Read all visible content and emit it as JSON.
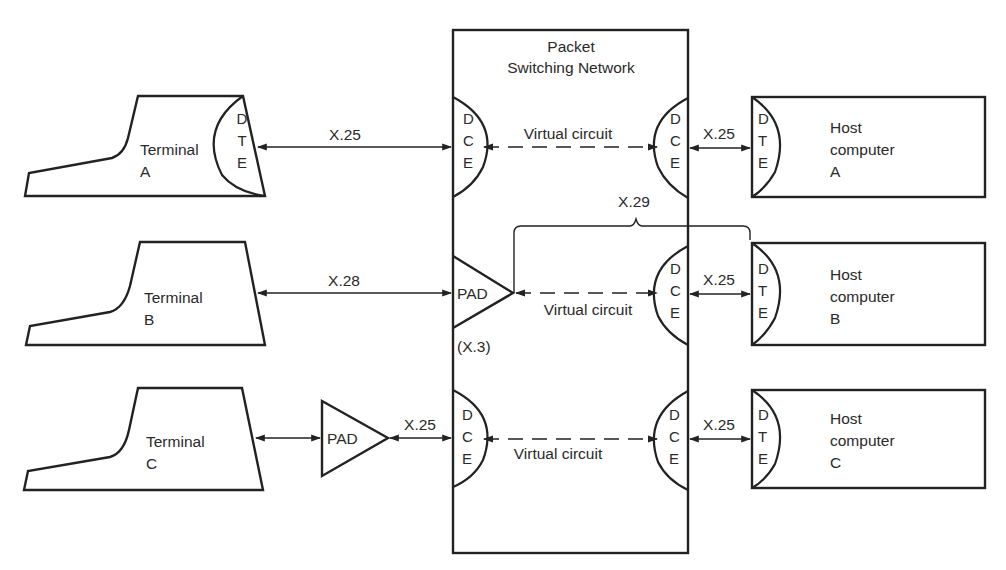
{
  "network": {
    "title_line1": "Packet",
    "title_line2": "Switching Network"
  },
  "terminals": [
    {
      "name": "Terminal",
      "id": "A",
      "has_dte": true
    },
    {
      "name": "Terminal",
      "id": "B",
      "has_dte": false
    },
    {
      "name": "Terminal",
      "id": "C",
      "has_dte": false
    }
  ],
  "hosts": [
    {
      "line1": "Host",
      "line2": "computer",
      "id": "A"
    },
    {
      "line1": "Host",
      "line2": "computer",
      "id": "B"
    },
    {
      "line1": "Host",
      "line2": "computer",
      "id": "C"
    }
  ],
  "interfaces": {
    "dte": [
      "D",
      "T",
      "E"
    ],
    "dce": [
      "D",
      "C",
      "E"
    ],
    "pad_label": "PAD",
    "pad_protocol": "(X.3)"
  },
  "links": {
    "row_a": {
      "left": "X.25",
      "middle": "Virtual circuit",
      "right": "X.25"
    },
    "row_b": {
      "left": "X.28",
      "middle": "Virtual circuit",
      "right": "X.25",
      "bracket": "X.29"
    },
    "row_c": {
      "left": "X.25",
      "middle": "Virtual circuit",
      "right": "X.25"
    }
  },
  "colors": {
    "line": "#222222",
    "text": "#2a2a2a",
    "background": "#ffffff"
  }
}
